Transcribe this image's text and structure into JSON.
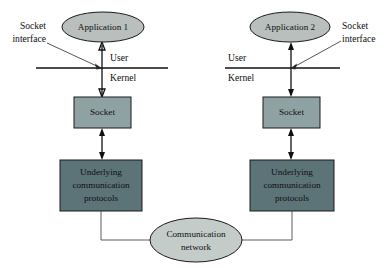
{
  "diagram": {
    "background_color": "#ffffff",
    "colors": {
      "application_fill": "#b9bfbc",
      "socket_fill": "#8fa2a3",
      "protocols_fill": "#5c7377",
      "network_fill": "#c4ccca",
      "stroke": "#1a1a1a",
      "text": "#101010"
    },
    "left_stack": {
      "application_label": "Application 1",
      "socket_interface_label_line1": "Socket",
      "socket_interface_label_line2": "interface",
      "user_label": "User",
      "kernel_label": "Kernel",
      "socket_label": "Socket",
      "protocols_label_line1": "Underlying",
      "protocols_label_line2": "communication",
      "protocols_label_line3": "protocols"
    },
    "right_stack": {
      "application_label": "Application 2",
      "socket_interface_label_line1": "Socket",
      "socket_interface_label_line2": "interface",
      "user_label": "User",
      "kernel_label": "Kernel",
      "socket_label": "Socket",
      "protocols_label_line1": "Underlying",
      "protocols_label_line2": "communication",
      "protocols_label_line3": "protocols"
    },
    "network": {
      "label_line1": "Communication",
      "label_line2": "network"
    }
  }
}
